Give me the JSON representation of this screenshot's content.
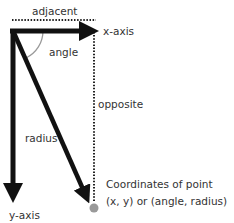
{
  "diagram": {
    "labels": {
      "adjacent": "adjacent",
      "x_axis": "x-axis",
      "angle": "angle",
      "opposite": "opposite",
      "radius": "radius",
      "y_axis": "y-axis",
      "point_line1": "Coordinates of point",
      "point_line2": "(x, y) or (angle, radius)"
    },
    "colors": {
      "axis": "#111111",
      "text": "#333333",
      "angle_arc": "#999999",
      "point": "#9a9a9a",
      "dotted": "#222222"
    }
  }
}
